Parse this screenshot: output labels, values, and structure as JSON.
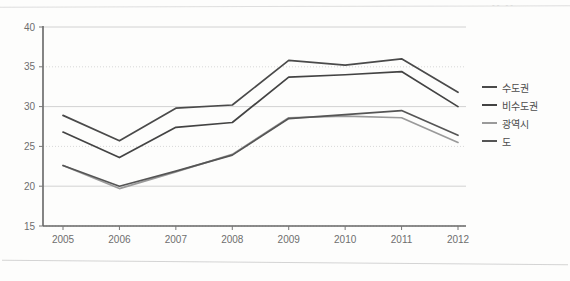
{
  "artifacts": {
    "corner_text": "-- --"
  },
  "legend": {
    "position": "right",
    "items": [
      {
        "label": "수도권",
        "color": "#4a4a4a"
      },
      {
        "label": "비수도권",
        "color": "#434343"
      },
      {
        "label": "광역시",
        "color": "#9a9a9a"
      },
      {
        "label": "도",
        "color": "#555555"
      }
    ]
  },
  "chart_data": {
    "type": "line",
    "title": "",
    "subtitle": "",
    "xlabel": "",
    "ylabel": "",
    "categories": [
      "2005",
      "2006",
      "2007",
      "2008",
      "2009",
      "2010",
      "2011",
      "2012"
    ],
    "x_tick_labels": [
      "2005",
      "2006",
      "2007",
      "2008",
      "2009",
      "2010",
      "2011",
      "2012"
    ],
    "y_tick_labels": [
      "15",
      "20",
      "25",
      "30",
      "35",
      "40"
    ],
    "y_ticks": [
      15,
      20,
      25,
      30,
      35,
      40
    ],
    "ylim": [
      15,
      40
    ],
    "grid": true,
    "grid_axis": "y",
    "legend_position": "right",
    "series": [
      {
        "name": "수도권",
        "color": "#4a4a4a",
        "values": [
          28.9,
          25.7,
          29.8,
          30.2,
          35.8,
          35.2,
          36.0,
          31.8
        ]
      },
      {
        "name": "비수도권",
        "color": "#434343",
        "values": [
          26.8,
          23.6,
          27.4,
          28.0,
          33.7,
          34.0,
          34.4,
          30.0
        ]
      },
      {
        "name": "광역시",
        "color": "#9a9a9a",
        "values": [
          22.6,
          19.7,
          21.8,
          24.0,
          28.6,
          28.8,
          28.6,
          25.5
        ]
      },
      {
        "name": "도",
        "color": "#555555",
        "values": [
          22.6,
          20.0,
          21.9,
          23.9,
          28.5,
          29.0,
          29.5,
          26.4
        ]
      }
    ]
  }
}
